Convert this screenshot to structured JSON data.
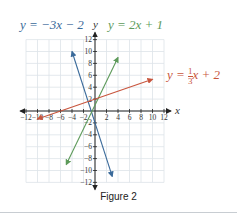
{
  "chart_data": {
    "type": "line",
    "title": "",
    "caption": "Figure 2",
    "xlabel": "x",
    "ylabel": "y",
    "xlim": [
      -12,
      12
    ],
    "ylim": [
      -12,
      12
    ],
    "grid": true,
    "x_ticks": [
      -12,
      -10,
      -8,
      -6,
      -4,
      -2,
      2,
      4,
      6,
      8,
      10,
      12
    ],
    "y_ticks": [
      12,
      10,
      8,
      6,
      4,
      2,
      -2,
      -4,
      -6,
      -8,
      -10,
      -12
    ],
    "series": [
      {
        "name": "y = −3x − 2",
        "equation": "y = -3x - 2",
        "slope": -3,
        "intercept": -2,
        "x_range": [
          -4,
          3
        ],
        "color": "#3a6a9a"
      },
      {
        "name": "y = 2x + 1",
        "equation": "y = 2x + 1",
        "slope": 2,
        "intercept": 1,
        "x_range": [
          -5,
          4
        ],
        "color": "#5d9a5a"
      },
      {
        "name": "y = (1/3)x + 2",
        "equation": "y = (1/3)x + 2",
        "slope": 0.3333,
        "intercept": 2,
        "x_range": [
          -10,
          10
        ],
        "color": "#c8553d"
      }
    ],
    "labels": {
      "blue": "y = −3x − 2",
      "green": "y = 2x + 1",
      "red_prefix": "y = ",
      "red_num": "1",
      "red_den": "3",
      "red_suffix": "x + 2"
    }
  }
}
